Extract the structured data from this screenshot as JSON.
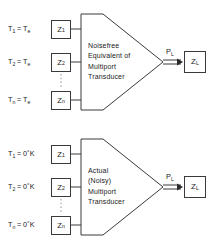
{
  "figure": {
    "type": "block-diagram",
    "panel_count": 2,
    "stroke_color": "#3a3a3a",
    "text_color": "#1a1a1a",
    "background": "#ffffff"
  },
  "panels": [
    {
      "id": "noisefree",
      "block_caption_lines": [
        "Noisefree",
        "Equivalent of",
        "Multiport",
        "Transducer"
      ],
      "sources": [
        {
          "temp_symbol": "T",
          "temp_sub": "1",
          "equals": "=",
          "temp_value": "T",
          "temp_value_sub": "e",
          "degree": "",
          "unit": "",
          "impedance": "Z",
          "impedance_sub": "1"
        },
        {
          "temp_symbol": "T",
          "temp_sub": "2",
          "equals": "=",
          "temp_value": "T",
          "temp_value_sub": "e",
          "degree": "",
          "unit": "",
          "impedance": "Z",
          "impedance_sub": "2"
        },
        {
          "temp_symbol": "T",
          "temp_sub": "n",
          "equals": "=",
          "temp_value": "T",
          "temp_value_sub": "e",
          "degree": "",
          "unit": "",
          "impedance": "Z",
          "impedance_sub": "n"
        }
      ],
      "output": {
        "power_symbol": "P",
        "power_sub": "L",
        "load_symbol": "Z",
        "load_sub": "L"
      }
    },
    {
      "id": "actual-noisy",
      "block_caption_lines": [
        "Actual",
        "(Noisy)",
        "Multiport",
        "Transducer"
      ],
      "sources": [
        {
          "temp_symbol": "T",
          "temp_sub": "1",
          "equals": "=",
          "temp_value": "0",
          "temp_value_sub": "",
          "degree": "°",
          "unit": "K",
          "impedance": "Z",
          "impedance_sub": "1"
        },
        {
          "temp_symbol": "T",
          "temp_sub": "2",
          "equals": "=",
          "temp_value": "0",
          "temp_value_sub": "",
          "degree": "°",
          "unit": "K",
          "impedance": "Z",
          "impedance_sub": "2"
        },
        {
          "temp_symbol": "T",
          "temp_sub": "n",
          "equals": "=",
          "temp_value": "0",
          "temp_value_sub": "",
          "degree": "°",
          "unit": "K",
          "impedance": "Z",
          "impedance_sub": "n"
        }
      ],
      "output": {
        "power_symbol": "P",
        "power_sub": "L",
        "load_symbol": "Z",
        "load_sub": "L"
      }
    }
  ]
}
